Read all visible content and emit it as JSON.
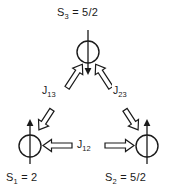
{
  "figure": {
    "type": "spin-triangle-diagram",
    "background_color": "#ffffff",
    "stroke_color": "#1a1a1a"
  },
  "sites": [
    {
      "id": "s3",
      "label_symbol": "S",
      "label_subscript": "3",
      "label_equals": " = ",
      "label_value": "5/2",
      "label_text": "S3 = 5/2",
      "spin_direction": "down",
      "position": {
        "cx": 88,
        "cy": 52,
        "r": 11
      }
    },
    {
      "id": "s1",
      "label_symbol": "S",
      "label_subscript": "1",
      "label_equals": " = ",
      "label_value": "2",
      "label_text": "S1 = 2",
      "spin_direction": "up",
      "position": {
        "cx": 30,
        "cy": 146,
        "r": 11
      }
    },
    {
      "id": "s2",
      "label_symbol": "S",
      "label_subscript": "2",
      "label_equals": " = ",
      "label_value": "5/2",
      "label_text": "S2 = 5/2",
      "spin_direction": "up",
      "position": {
        "cx": 147,
        "cy": 146,
        "r": 11
      }
    }
  ],
  "couplings": [
    {
      "id": "j13",
      "label_symbol": "J",
      "label_subscript": "13",
      "label_text": "J13",
      "connects": [
        "s1",
        "s3"
      ],
      "arrow_style": "double-headed-hollow-block"
    },
    {
      "id": "j23",
      "label_symbol": "J",
      "label_subscript": "23",
      "label_text": "J23",
      "connects": [
        "s2",
        "s3"
      ],
      "arrow_style": "double-headed-hollow-block"
    },
    {
      "id": "j12",
      "label_symbol": "J",
      "label_subscript": "12",
      "label_text": "J12",
      "connects": [
        "s1",
        "s2"
      ],
      "arrow_style": "double-headed-hollow-block"
    }
  ],
  "colors": {
    "ink": "#1a1a1a",
    "paper": "#ffffff"
  }
}
